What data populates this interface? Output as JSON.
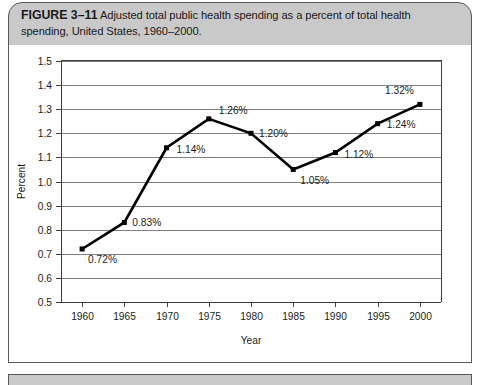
{
  "figure": {
    "label": "FIGURE 3–11",
    "caption": "Adjusted total public health spending as a percent of total health spending, United States, 1960–2000.",
    "source_note": ""
  },
  "chart_data": {
    "type": "line",
    "title": "",
    "xlabel": "Year",
    "ylabel": "Percent",
    "categories": [
      "1960",
      "1965",
      "1970",
      "1975",
      "1980",
      "1985",
      "1990",
      "1995",
      "2000"
    ],
    "x": [
      1960,
      1965,
      1970,
      1975,
      1980,
      1985,
      1990,
      1995,
      2000
    ],
    "values": [
      0.72,
      0.83,
      1.14,
      1.26,
      1.2,
      1.05,
      1.12,
      1.24,
      1.32
    ],
    "point_labels": [
      "0.72%",
      "0.83%",
      "1.14%",
      "1.26%",
      "1.20%",
      "1.05%",
      "1.12%",
      "1.24%",
      "1.32%"
    ],
    "ylim": [
      0.5,
      1.5
    ],
    "ytick_step": 0.1,
    "ytick_labels": [
      "0.5",
      "0.6",
      "0.7",
      "0.8",
      "0.9",
      "1.0",
      "1.1",
      "1.2",
      "1.3",
      "1.4",
      "1.5"
    ],
    "xlim": [
      1957.5,
      2002.5
    ],
    "grid": "horizontal",
    "legend": "none",
    "marker": "square",
    "line_color": "#000000",
    "grid_color": "#808080",
    "axis_color": "#3c3c3c"
  },
  "style": {
    "header_background": "#c9c9c9",
    "border_color": "#58585a",
    "body_background": "#ffffff",
    "text_color": "#1a1a1a"
  }
}
